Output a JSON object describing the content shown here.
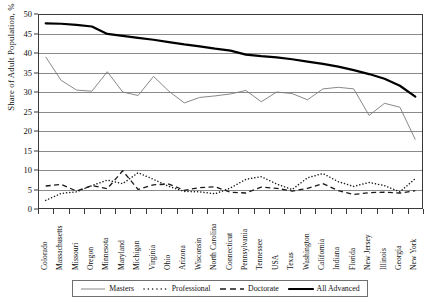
{
  "chart_data": {
    "type": "line",
    "title": "",
    "xlabel": "",
    "ylabel": "Share of Adult Population, %",
    "ylim": [
      0,
      50
    ],
    "ytick_step": 5,
    "yticks": [
      "0",
      "5",
      "10",
      "15",
      "20",
      "25",
      "30",
      "35",
      "40",
      "45",
      "50"
    ],
    "grid": "horizontal",
    "legend_position": "bottom",
    "categories": [
      "Colorado",
      "Massachusetts",
      "Missouri",
      "Oregon",
      "Minnesota",
      "Maryland",
      "Michigan",
      "Virginia",
      "Ohio",
      "Arizona",
      "Wisconsin",
      "North Carolina",
      "Connecticut",
      "Pennsylvania",
      "Tennessee",
      "USA",
      "Texas",
      "Washington",
      "California",
      "Indiana",
      "Florida",
      "New Jersey",
      "Illinois",
      "Georgia",
      "New York"
    ],
    "series": [
      {
        "name": "Masters",
        "style": "solid-thin",
        "color": "#7a7a7a",
        "values": [
          39.0,
          33.0,
          30.5,
          30.2,
          35.2,
          30.0,
          29.1,
          34.0,
          30.2,
          27.2,
          28.6,
          29.0,
          29.5,
          30.4,
          27.5,
          30.0,
          29.6,
          28.0,
          30.8,
          31.2,
          30.8,
          24.0,
          27.1,
          26.1,
          17.8
        ]
      },
      {
        "name": "Professional",
        "style": "dotted",
        "color": "#1a1a1a",
        "values": [
          2.2,
          4.0,
          4.4,
          6.0,
          7.4,
          6.5,
          9.3,
          7.6,
          5.8,
          4.5,
          4.4,
          3.9,
          5.4,
          7.6,
          8.3,
          6.4,
          5.0,
          8.0,
          9.1,
          7.0,
          5.8,
          6.8,
          6.0,
          4.4,
          7.8
        ]
      },
      {
        "name": "Doctorate",
        "style": "dashed",
        "color": "#1a1a1a",
        "values": [
          5.9,
          6.3,
          4.6,
          6.0,
          5.2,
          9.8,
          5.0,
          6.2,
          6.4,
          4.8,
          5.5,
          5.7,
          4.3,
          4.1,
          5.6,
          5.3,
          4.6,
          5.3,
          6.5,
          4.7,
          3.7,
          4.2,
          4.3,
          4.1,
          4.7
        ]
      },
      {
        "name": "All Advanced",
        "style": "solid-thick",
        "color": "#000000",
        "values": [
          47.6,
          47.5,
          47.2,
          46.8,
          44.9,
          44.4,
          43.9,
          43.4,
          42.8,
          42.2,
          41.7,
          41.1,
          40.6,
          39.6,
          39.2,
          38.9,
          38.4,
          37.8,
          37.2,
          36.5,
          35.6,
          34.6,
          33.4,
          31.6,
          28.8
        ]
      }
    ],
    "legend": [
      {
        "label": "Masters",
        "style": "solid-thin"
      },
      {
        "label": "Professional",
        "style": "dotted"
      },
      {
        "label": "Doctorate",
        "style": "dashed"
      },
      {
        "label": "All Advanced",
        "style": "solid-thick"
      }
    ]
  }
}
